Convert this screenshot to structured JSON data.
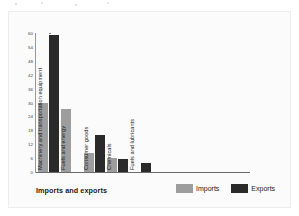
{
  "chart_data": {
    "type": "bar",
    "title": "",
    "xlabel": "Imports and exports",
    "ylabel": "Percentage of total",
    "ylim": [
      0,
      60
    ],
    "yticks": [
      60,
      54,
      48,
      42,
      36,
      30,
      24,
      18,
      12,
      6,
      0
    ],
    "grid": false,
    "legend_position": "bottom-right",
    "categories": [
      "Machinery and transportation equipment",
      "Fuels and energy",
      "Consumer goods",
      "Chemicals",
      "Fuels and lubricants"
    ],
    "series": [
      {
        "name": "Imports",
        "color": "#9d9d9d",
        "values": [
          30,
          27,
          8,
          6,
          0
        ]
      },
      {
        "name": "Exports",
        "color": "#2a2a2a",
        "values": [
          59,
          0,
          16,
          5.5,
          4
        ]
      }
    ]
  },
  "axes": {
    "y_title": "Percentage of total",
    "x_title": "Imports and exports",
    "tick_0": "0",
    "tick_1": "6",
    "tick_2": "12",
    "tick_3": "18",
    "tick_4": "24",
    "tick_5": "30",
    "tick_6": "36",
    "tick_7": "42",
    "tick_8": "48",
    "tick_9": "54",
    "tick_10": "60"
  },
  "legend": {
    "imports_label": "Imports",
    "exports_label": "Exports",
    "imports_color": "#9d9d9d",
    "exports_color": "#2a2a2a"
  }
}
